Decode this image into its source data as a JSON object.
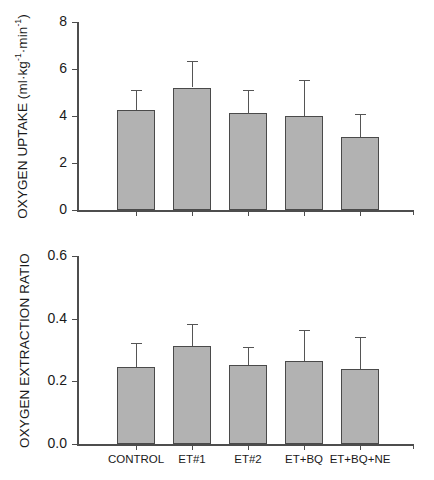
{
  "figure": {
    "width": 434,
    "height": 480,
    "bar_fill_color": "#b2b2b2",
    "bar_edge_color": "#4a4a4a",
    "axis_color": "#4d4d4d"
  },
  "chart_data": [
    {
      "type": "bar",
      "panel": "top",
      "title": "",
      "xlabel": "",
      "ylabel": "OXYGEN UPTAKE (ml·kg⁻¹·min⁻¹)",
      "ylabel_parts": {
        "main": "OXYGEN UPTAKE (ml",
        "dot1": "·",
        "kg": "kg",
        "sup1": "-1",
        "dot2": "·",
        "min": "min",
        "sup2": "-1",
        "close": ")"
      },
      "categories": [
        "CONTROL",
        "ET#1",
        "ET#2",
        "ET+BQ",
        "ET+BQ+NE"
      ],
      "values": [
        4.25,
        5.2,
        4.12,
        4.0,
        3.1
      ],
      "errors": [
        0.85,
        1.12,
        1.0,
        1.55,
        1.0
      ],
      "error_type": "SD",
      "ylim": [
        0,
        8
      ],
      "yticks": [
        0,
        2,
        4,
        6,
        8
      ],
      "ytick_labels": [
        "0",
        "2",
        "4",
        "6",
        "8"
      ],
      "xtick_labels_shown": false,
      "grid": false,
      "legend": false
    },
    {
      "type": "bar",
      "panel": "bottom",
      "title": "",
      "xlabel": "",
      "ylabel": "OXYGEN EXTRACTION RATIO",
      "categories": [
        "CONTROL",
        "ET#1",
        "ET#2",
        "ET+BQ",
        "ET+BQ+NE"
      ],
      "values": [
        0.245,
        0.312,
        0.253,
        0.265,
        0.238
      ],
      "errors": [
        0.077,
        0.07,
        0.057,
        0.099,
        0.103
      ],
      "error_type": "SD",
      "ylim": [
        0.0,
        0.6
      ],
      "yticks": [
        0.0,
        0.2,
        0.4,
        0.6
      ],
      "ytick_labels": [
        "0.0",
        "0.2",
        "0.4",
        "0.6"
      ],
      "xtick_labels_shown": true,
      "grid": false,
      "legend": false
    }
  ]
}
